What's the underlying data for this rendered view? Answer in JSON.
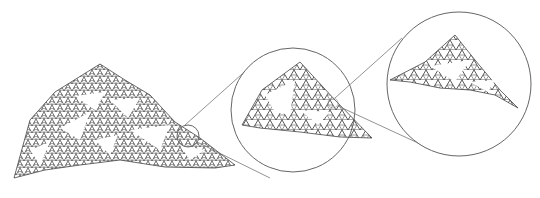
{
  "diagram": {
    "colors": {
      "background": "#ffffff",
      "stroke": "#555555",
      "fractal": "#222222"
    },
    "main_fractal": {
      "label": "fractal-landscape"
    },
    "zoom_levels": [
      {
        "name": "small-magnifier",
        "cx": 188,
        "cy": 136,
        "r": 11
      },
      {
        "name": "zoom-circle-1",
        "cx": 293,
        "cy": 110,
        "r": 62
      },
      {
        "name": "zoom-circle-2",
        "cx": 459,
        "cy": 84,
        "r": 72
      }
    ]
  }
}
